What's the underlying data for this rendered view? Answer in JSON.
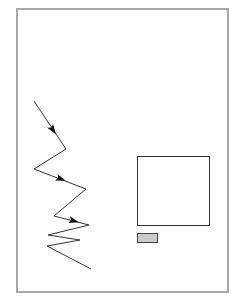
{
  "diagram": {
    "frame": {
      "x": 16,
      "y": 8,
      "width": 213,
      "height": 285,
      "stroke": "#a8a8a8"
    },
    "zigzag_path": {
      "points": [
        [
          34,
          101
        ],
        [
          66,
          149
        ],
        [
          34,
          169
        ],
        [
          86,
          189
        ],
        [
          54,
          216
        ],
        [
          89,
          225
        ],
        [
          48,
          235
        ],
        [
          80,
          240
        ],
        [
          47,
          246
        ],
        [
          91,
          269
        ]
      ],
      "stroke": "#333333",
      "arrowheads": [
        {
          "x": 53,
          "y": 130,
          "angle": 56
        },
        {
          "x": 61,
          "y": 179,
          "angle": 21
        },
        {
          "x": 74,
          "y": 221,
          "angle": 15
        }
      ]
    },
    "large_square": {
      "x": 137,
      "y": 156,
      "width": 72,
      "height": 69,
      "stroke": "#333333",
      "fill": "#ffffff"
    },
    "small_box": {
      "x": 137,
      "y": 233,
      "width": 20,
      "height": 9,
      "stroke": "#444444",
      "fill": "#cccccc"
    }
  }
}
